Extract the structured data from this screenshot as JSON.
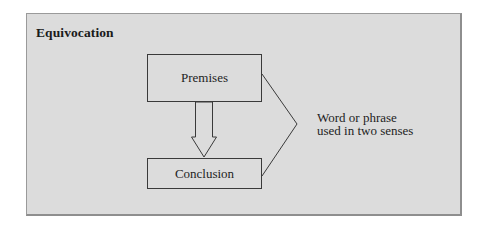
{
  "diagram": {
    "title": "Equivocation",
    "nodes": {
      "premises": "Premises",
      "conclusion": "Conclusion"
    },
    "annotation": {
      "line1": "Word or phrase",
      "line2": "used in two senses"
    },
    "edges": [
      {
        "from": "premises",
        "to": "conclusion",
        "style": "hollow-block-arrow"
      },
      {
        "from": "annotation",
        "to": [
          "premises",
          "conclusion"
        ],
        "style": "bracket-lines"
      }
    ],
    "colors": {
      "panel_fill": "#dcdcdc",
      "panel_border": "#9a9a9a",
      "stroke": "#3a3a3a",
      "text": "#1e1e1e"
    }
  }
}
